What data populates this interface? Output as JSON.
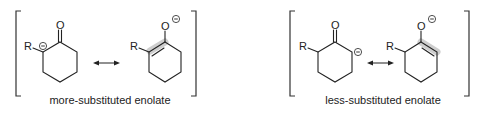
{
  "panels": [
    {
      "id": "more-substituted",
      "caption": "more-substituted enolate",
      "left_structure": {
        "substituent": "R",
        "carbonyl_atom": "O",
        "charge": "−"
      },
      "right_structure": {
        "substituent": "R",
        "oxygen_atom": "O",
        "charge": "−"
      }
    },
    {
      "id": "less-substituted",
      "caption": "less-substituted enolate",
      "left_structure": {
        "substituent": "R",
        "carbonyl_atom": "O",
        "charge": "−"
      },
      "right_structure": {
        "substituent": "R",
        "oxygen_atom": "O",
        "charge": "−"
      }
    }
  ],
  "colors": {
    "ink": "#222222",
    "highlight": "#bdbdbd",
    "background": "#ffffff"
  }
}
